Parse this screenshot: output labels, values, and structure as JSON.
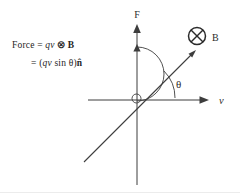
{
  "figure": {
    "formula": {
      "line1": {
        "lhs": "Force = ",
        "qv": "qv",
        "operator": "⊗",
        "field_vector": "B"
      },
      "line2": {
        "eq_open": "= (",
        "qv": "qv",
        "sin": " sin ",
        "theta": "θ",
        "close": ")",
        "unit_normal": "n̂"
      }
    },
    "axis_labels": {
      "vertical": "F",
      "horizontal": "v"
    },
    "field_label": "B",
    "angle_label": "θ",
    "into_page_symbol": "⊗"
  },
  "colors": {
    "ink": "#2b2b2b",
    "line": "#3d3d3d",
    "background": "#ffffff"
  }
}
